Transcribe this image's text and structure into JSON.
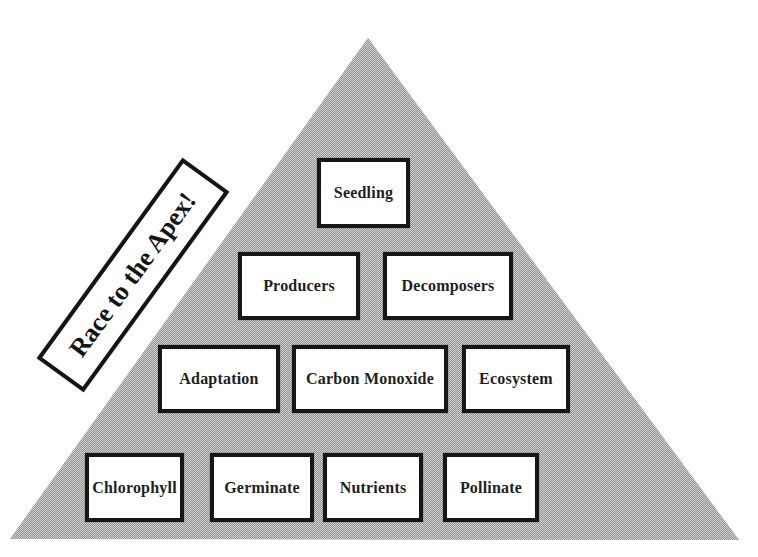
{
  "diagram": {
    "banner_label": "Race to the Apex!",
    "pyramid": {
      "shape": "triangle",
      "rows": [
        {
          "boxes": [
            {
              "label": "Seedling"
            }
          ]
        },
        {
          "boxes": [
            {
              "label": "Producers"
            },
            {
              "label": "Decomposers"
            }
          ]
        },
        {
          "boxes": [
            {
              "label": "Adaptation"
            },
            {
              "label": "Carbon Monoxide"
            },
            {
              "label": "Ecosystem"
            }
          ]
        },
        {
          "boxes": [
            {
              "label": "Chlorophyll"
            },
            {
              "label": "Germinate"
            },
            {
              "label": "Nutrients"
            },
            {
              "label": "Pollinate"
            }
          ]
        }
      ]
    },
    "colors": {
      "triangle_fill": "#b1b1b1",
      "box_fill": "#ffffff",
      "box_border": "#161616",
      "text": "#1f1f1f",
      "page_background": "#ffffff"
    }
  }
}
